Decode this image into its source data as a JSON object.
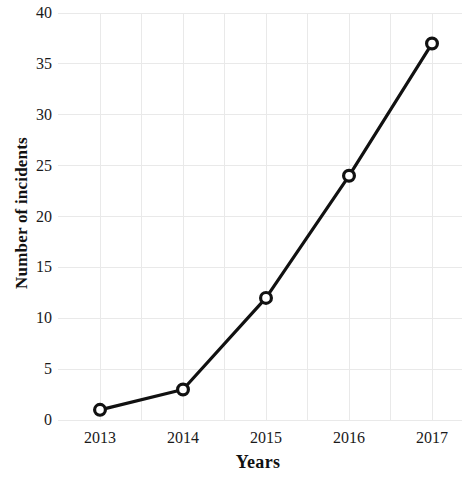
{
  "chart_data": {
    "type": "line",
    "title": "",
    "subtitle": "",
    "xlabel": "Years",
    "ylabel": "Number of incidents",
    "categories": [
      "2013",
      "2014",
      "2015",
      "2016",
      "2017"
    ],
    "x": [
      2013,
      2014,
      2015,
      2016,
      2017
    ],
    "values": [
      1,
      3,
      12,
      24,
      37
    ],
    "series": [
      {
        "name": "Number of incidents",
        "values": [
          1,
          3,
          12,
          24,
          37
        ]
      }
    ],
    "xlim": [
      2012.5,
      2017.5
    ],
    "ylim": [
      0,
      40
    ],
    "y_ticks": [
      0,
      5,
      10,
      15,
      20,
      25,
      30,
      35,
      40
    ],
    "y_tick_labels": [
      "0",
      "5",
      "10",
      "15",
      "20",
      "25",
      "30",
      "35",
      "40"
    ],
    "x_ticks": [
      2013,
      2014,
      2015,
      2016,
      2017
    ],
    "x_tick_labels": [
      "2013",
      "2014",
      "2015",
      "2016",
      "2017"
    ],
    "grid": true,
    "legend": false,
    "legend_position": "none",
    "annotations": [],
    "colors": {
      "line": "#111111",
      "marker_fill": "#ffffff",
      "marker_stroke": "#111111",
      "grid": "#e9e9e9",
      "background": "#ffffff",
      "text": "#111111"
    },
    "marker_style": "open-circle",
    "line_width": 3.2,
    "points": [
      {
        "x": "2013",
        "y": 1
      },
      {
        "x": "2014",
        "y": 3
      },
      {
        "x": "2015",
        "y": 12
      },
      {
        "x": "2016",
        "y": 24
      },
      {
        "x": "2017",
        "y": 37
      }
    ]
  }
}
